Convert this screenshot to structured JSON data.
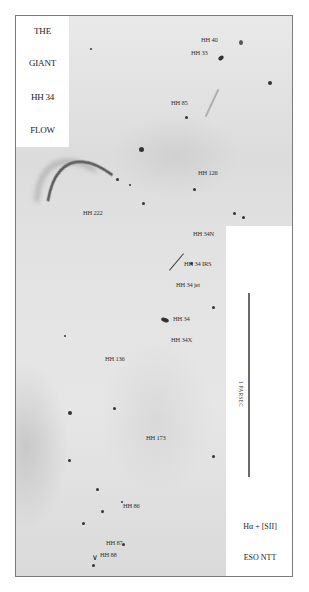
{
  "figure": {
    "title_lines": [
      "THE",
      "GIANT",
      "HH 34",
      "FLOW"
    ],
    "scale_bar": {
      "label": "1 PARSEC"
    },
    "filter": "Hα + [SII]",
    "telescope": "ESO NTT"
  },
  "objects": [
    {
      "id": "hh40",
      "label": "HH 40"
    },
    {
      "id": "hh33",
      "label": "HH 33"
    },
    {
      "id": "hh85",
      "label": "HH 85"
    },
    {
      "id": "hh126",
      "label": "HH 126"
    },
    {
      "id": "hh222",
      "label": "HH 222"
    },
    {
      "id": "hh34n",
      "label": "HH 34N"
    },
    {
      "id": "hh34irs",
      "label": "HH 34 IRS"
    },
    {
      "id": "hh34jet",
      "label": "HH 34 jet"
    },
    {
      "id": "hh34",
      "label": "HH 34"
    },
    {
      "id": "hh34x",
      "label": "HH 34X"
    },
    {
      "id": "hh136",
      "label": "HH 136"
    },
    {
      "id": "hh173",
      "label": "HH 173"
    },
    {
      "id": "hh86",
      "label": "HH 86"
    },
    {
      "id": "hh87",
      "label": "HH 87"
    },
    {
      "id": "hh88",
      "label": "HH 88"
    }
  ]
}
